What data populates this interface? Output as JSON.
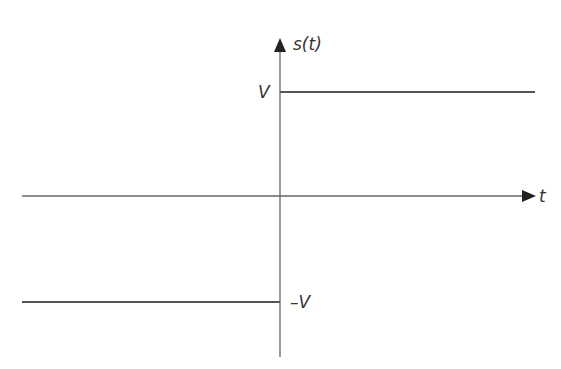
{
  "diagram": {
    "type": "signal-plot",
    "y_axis_label": "s(t)",
    "x_axis_label": "t",
    "levels": {
      "high": "V",
      "low": "–V"
    },
    "colors": {
      "axis": "#555555",
      "signal": "#444444",
      "text": "#333333"
    }
  }
}
